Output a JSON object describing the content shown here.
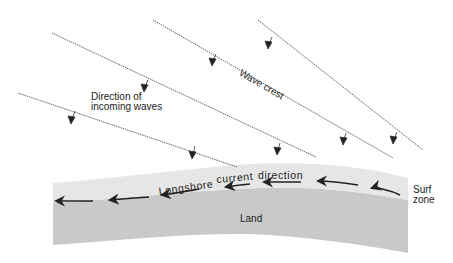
{
  "labels": {
    "direction_line1": "Direction of",
    "direction_line2": "incoming waves",
    "wave_crest": "Wave crest",
    "longshore": "Longshore",
    "current": "current",
    "direction": "direction",
    "surf_line1": "Surf",
    "surf_line2": "zone",
    "land": "Land"
  },
  "colors": {
    "background": "#ffffff",
    "surf_zone": "#e6e6e6",
    "land": "#c9c9c9",
    "ink": "#222222",
    "wave_line": "#555555"
  },
  "wave_crests": [
    {
      "from": [
        18,
        93
      ],
      "to": [
        237,
        167
      ]
    },
    {
      "from": [
        52,
        33
      ],
      "to": [
        316,
        157
      ]
    },
    {
      "from": [
        153,
        20
      ],
      "to": [
        393,
        158
      ]
    },
    {
      "from": [
        258,
        20
      ],
      "to": [
        423,
        150
      ]
    }
  ]
}
